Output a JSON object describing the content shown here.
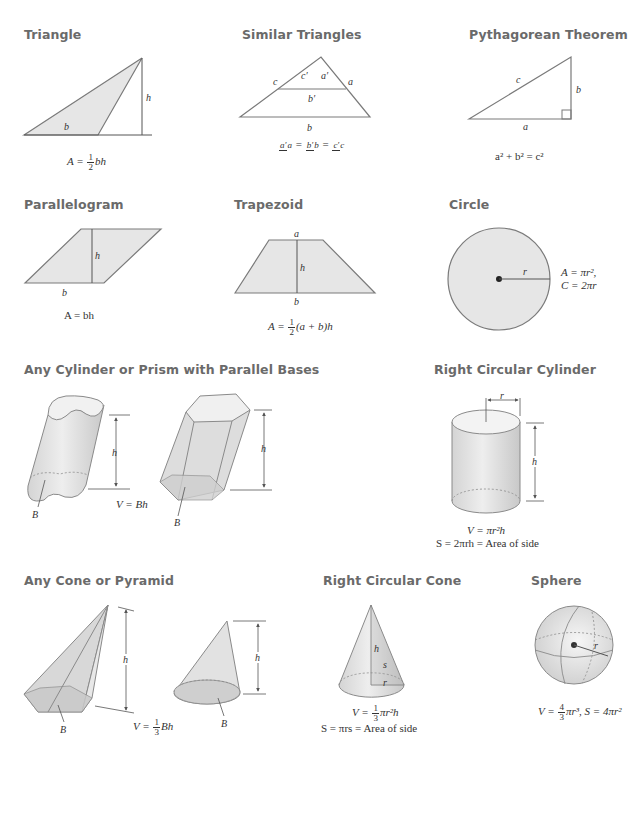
{
  "sections": {
    "triangle": {
      "title": "Triangle",
      "labels": {
        "b": "b",
        "h": "h"
      },
      "formula": {
        "lhs": "A = ",
        "frac_num": "1",
        "frac_den": "2",
        "rhs": "bh"
      }
    },
    "similar_triangles": {
      "title": "Similar Triangles",
      "labels": {
        "a": "a",
        "b": "b",
        "c": "c",
        "a_prime": "a′",
        "b_prime": "b′",
        "c_prime": "c′"
      },
      "formula": {
        "f1_num": "a′",
        "f1_den": "a",
        "f2_num": "b′",
        "f2_den": "b",
        "f3_num": "c′",
        "f3_den": "c",
        "eq": "="
      }
    },
    "pythagorean": {
      "title": "Pythagorean Theorem",
      "labels": {
        "a": "a",
        "b": "b",
        "c": "c"
      },
      "formula": "a² + b² = c²"
    },
    "parallelogram": {
      "title": "Parallelogram",
      "labels": {
        "b": "b",
        "h": "h"
      },
      "formula": "A = bh"
    },
    "trapezoid": {
      "title": "Trapezoid",
      "labels": {
        "a": "a",
        "b": "b",
        "h": "h"
      },
      "formula": {
        "lhs": "A = ",
        "frac_num": "1",
        "frac_den": "2",
        "rhs": "(a + b)h"
      }
    },
    "circle": {
      "title": "Circle",
      "labels": {
        "r": "r"
      },
      "formula_line1": "A = πr²,",
      "formula_line2": "C = 2πr"
    },
    "cylinder_prism": {
      "title": "Any Cylinder or Prism with Parallel Bases",
      "labels": {
        "h1": "h",
        "h2": "h",
        "B1": "B",
        "B2": "B"
      },
      "formula": "V = Bh"
    },
    "right_cylinder": {
      "title": "Right Circular Cylinder",
      "labels": {
        "r": "r",
        "h": "h"
      },
      "formula_line1": "V = πr²h",
      "formula_line2": "S = 2πrh = Area of side"
    },
    "cone_pyramid": {
      "title": "Any Cone or Pyramid",
      "labels": {
        "h1": "h",
        "h2": "h",
        "B1": "B",
        "B2": "B"
      },
      "formula": {
        "lhs": "V = ",
        "frac_num": "1",
        "frac_den": "3",
        "rhs": "Bh"
      }
    },
    "right_cone": {
      "title": "Right Circular Cone",
      "labels": {
        "h": "h",
        "s": "s",
        "r": "r"
      },
      "formula_line1": {
        "lhs": "V = ",
        "frac_num": "1",
        "frac_den": "3",
        "rhs": "πr²h"
      },
      "formula_line2": "S = πrs = Area of side"
    },
    "sphere": {
      "title": "Sphere",
      "labels": {
        "r": "r"
      },
      "formula": {
        "lhs": "V = ",
        "frac_num": "4",
        "frac_den": "3",
        "rhs": "πr³, S = 4πr²"
      }
    }
  },
  "colors": {
    "fill": "#e6e6e6",
    "stroke": "#7a7a7a",
    "title": "#6a6a6a",
    "text": "#333333"
  }
}
